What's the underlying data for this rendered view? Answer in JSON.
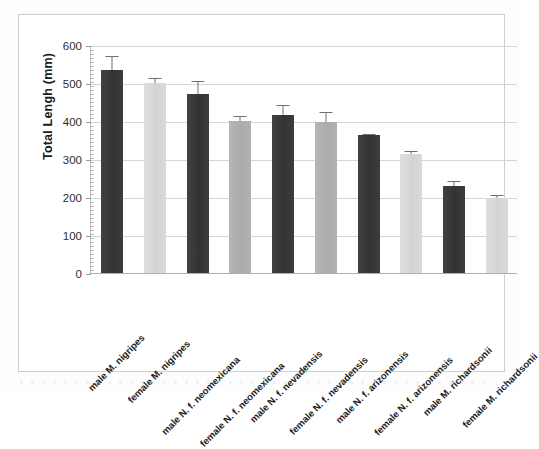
{
  "chart_data": {
    "type": "bar",
    "title": "",
    "xlabel": "",
    "ylabel": "Total Lengh (mm)",
    "ylim": [
      0,
      600
    ],
    "yticks": [
      0,
      100,
      200,
      300,
      400,
      500,
      600
    ],
    "ytick_labels": [
      "0",
      "100",
      "200",
      "300",
      "400",
      "500",
      "600"
    ],
    "grid": true,
    "legend": "none",
    "categories": [
      "male M. nigripes",
      "female M. nigripes",
      "male N. f. neomexicana",
      "female N. f. neomexicana",
      "male N. f. nevadensis",
      "female N. f. nevadensis",
      "male N. f. arizonensis",
      "female N. f. arizonensis",
      "male M. richardsonii",
      "female M. richardsonii"
    ],
    "values": [
      533,
      500,
      472,
      400,
      417,
      398,
      362,
      312,
      228,
      197
    ],
    "errors": [
      38,
      12,
      33,
      14,
      25,
      25,
      4,
      10,
      14,
      9
    ],
    "bar_shades": [
      "dark",
      "light",
      "dark",
      "medium",
      "dark",
      "medium",
      "dark",
      "light",
      "dark",
      "light"
    ]
  },
  "colors": {
    "bar_dark": "#3a3a3a",
    "bar_medium": "#b0b0b0",
    "bar_light": "#d9d9d9",
    "gridline": "#d6d6d6",
    "axis": "#b0b0b0",
    "frame": "#cfcfcf",
    "text": "#1d1d1d",
    "errorbar": "#6f6f6f"
  }
}
